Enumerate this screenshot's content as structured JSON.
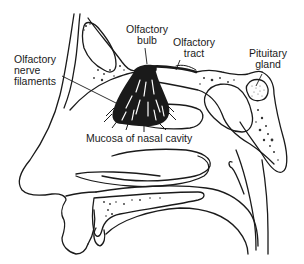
{
  "diagram": {
    "labels": {
      "olfactory_bulb": {
        "line1": "Olfactory",
        "line2": "bulb"
      },
      "olfactory_tract": {
        "line1": "Olfactory",
        "line2": "tract"
      },
      "pituitary_gland": {
        "line1": "Pituitary",
        "line2": "gland"
      },
      "olfactory_nerve_filaments": {
        "line1": "Olfactory",
        "line2": "nerve",
        "line3": "filaments"
      },
      "mucosa": {
        "text": "Mucosa of nasal cavity"
      }
    },
    "colors": {
      "ink": "#1a1a1a",
      "background": "#ffffff",
      "stipple": "#333333"
    }
  }
}
